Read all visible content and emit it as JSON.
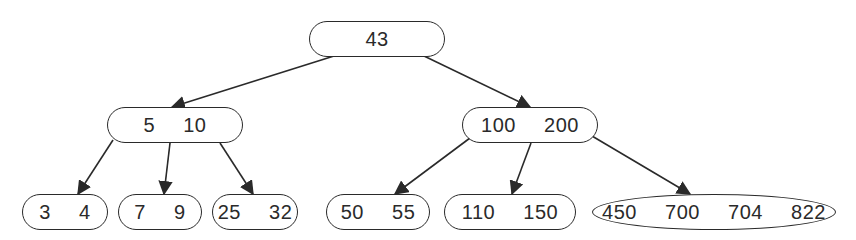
{
  "diagram": {
    "type": "b-tree",
    "stroke_color": "#2a2a2a",
    "nodes": [
      {
        "id": "root",
        "label": "43",
        "keys": [
          43
        ],
        "x": 309,
        "y": 21,
        "w": 136,
        "h": 36,
        "shape": "pill"
      },
      {
        "id": "left",
        "label": "5  10",
        "keys": [
          5,
          10
        ],
        "x": 107,
        "y": 107,
        "w": 136,
        "h": 36,
        "shape": "pill"
      },
      {
        "id": "right",
        "label": "100  200",
        "keys": [
          100,
          200
        ],
        "x": 462,
        "y": 107,
        "w": 136,
        "h": 36,
        "shape": "pill"
      },
      {
        "id": "leaf-1",
        "label": "3  4",
        "keys": [
          3,
          4
        ],
        "x": 22,
        "y": 194,
        "w": 86,
        "h": 36,
        "shape": "pill"
      },
      {
        "id": "leaf-2",
        "label": "7  9",
        "keys": [
          7,
          9
        ],
        "x": 118,
        "y": 194,
        "w": 84,
        "h": 36,
        "shape": "pill"
      },
      {
        "id": "leaf-3",
        "label": "25  32",
        "keys": [
          25,
          32
        ],
        "x": 212,
        "y": 194,
        "w": 86,
        "h": 36,
        "shape": "pill"
      },
      {
        "id": "leaf-4",
        "label": "50  55",
        "keys": [
          50,
          55
        ],
        "x": 326,
        "y": 194,
        "w": 104,
        "h": 36,
        "shape": "pill"
      },
      {
        "id": "leaf-5",
        "label": "110  150",
        "keys": [
          110,
          150
        ],
        "x": 444,
        "y": 194,
        "w": 132,
        "h": 36,
        "shape": "pill"
      },
      {
        "id": "leaf-6",
        "label": "450  700  704  822",
        "keys": [
          450,
          700,
          704,
          822
        ],
        "x": 592,
        "y": 194,
        "w": 244,
        "h": 36,
        "shape": "oval"
      }
    ],
    "edges": [
      {
        "from": "root",
        "to": "left",
        "x1": 334,
        "y1": 56,
        "x2": 172,
        "y2": 107
      },
      {
        "from": "root",
        "to": "right",
        "x1": 424,
        "y1": 56,
        "x2": 530,
        "y2": 107
      },
      {
        "from": "left",
        "to": "leaf-1",
        "x1": 113,
        "y1": 140,
        "x2": 78,
        "y2": 194
      },
      {
        "from": "left",
        "to": "leaf-2",
        "x1": 170,
        "y1": 143,
        "x2": 164,
        "y2": 194
      },
      {
        "from": "left",
        "to": "leaf-3",
        "x1": 220,
        "y1": 143,
        "x2": 253,
        "y2": 194
      },
      {
        "from": "right",
        "to": "leaf-4",
        "x1": 470,
        "y1": 138,
        "x2": 395,
        "y2": 194
      },
      {
        "from": "right",
        "to": "leaf-5",
        "x1": 531,
        "y1": 143,
        "x2": 512,
        "y2": 194
      },
      {
        "from": "right",
        "to": "leaf-6",
        "x1": 592,
        "y1": 136,
        "x2": 690,
        "y2": 194
      }
    ]
  }
}
